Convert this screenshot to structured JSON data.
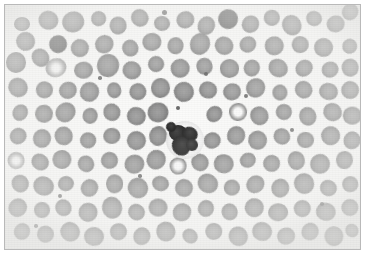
{
  "figure": {
    "modality": "light-microscopy",
    "stain": "grayscale (monochrome reproduction of Wright-Giemsa)",
    "frame": {
      "border_color": "#b9b9b9",
      "border_width_px": 1,
      "margin_px": 4
    },
    "canvas": {
      "width_px": 367,
      "height_px": 256,
      "background_color": "#fbfbfa"
    },
    "palette": {
      "background": "#fbfbfa",
      "rbc_mid_gray": "#8e8e8e",
      "rbc_dark_gray": "#5c5c5c",
      "rbc_pale_center": "#f7f7f7",
      "wbc_nucleus": "#1e1e1e",
      "wbc_cytoplasm": "#f4f4f4",
      "frame": "#b9b9b9"
    },
    "caption": "",
    "labels": [],
    "scale_bar": null,
    "annotations": []
  },
  "cells": {
    "white_blood_cells": [
      {
        "name": "neutrophil",
        "cx": 185,
        "cy": 140,
        "r": 19,
        "nucleus_lobes": [
          {
            "cx": 178,
            "cy": 133,
            "rx": 9,
            "ry": 8
          },
          {
            "cx": 190,
            "cy": 134,
            "rx": 8,
            "ry": 7
          },
          {
            "cx": 181,
            "cy": 146,
            "rx": 10,
            "ry": 9
          },
          {
            "cx": 192,
            "cy": 145,
            "rx": 6,
            "ry": 6
          },
          {
            "cx": 171,
            "cy": 127,
            "rx": 5,
            "ry": 5
          }
        ],
        "bridges": [
          {
            "cx": 184,
            "cy": 138,
            "w": 12,
            "h": 7,
            "rot": 18
          },
          {
            "cx": 186,
            "cy": 144,
            "w": 11,
            "h": 6,
            "rot": -14
          }
        ]
      }
    ],
    "red_blood_cells": [
      {
        "cx": 22,
        "cy": 24,
        "r": 9,
        "t": "normal"
      },
      {
        "cx": 26,
        "cy": 42,
        "r": 10,
        "t": "normal"
      },
      {
        "cx": 48,
        "cy": 20,
        "r": 9,
        "t": "normal"
      },
      {
        "cx": 73,
        "cy": 22,
        "r": 10,
        "t": "normal"
      },
      {
        "cx": 98,
        "cy": 19,
        "r": 8,
        "t": "normal"
      },
      {
        "cx": 118,
        "cy": 26,
        "r": 9,
        "t": "normal"
      },
      {
        "cx": 140,
        "cy": 18,
        "r": 8,
        "t": "normal"
      },
      {
        "cx": 162,
        "cy": 23,
        "r": 9,
        "t": "normal"
      },
      {
        "cx": 186,
        "cy": 20,
        "r": 9,
        "t": "normal"
      },
      {
        "cx": 206,
        "cy": 26,
        "r": 9,
        "t": "normal"
      },
      {
        "cx": 228,
        "cy": 19,
        "r": 9,
        "t": "dark"
      },
      {
        "cx": 250,
        "cy": 24,
        "r": 9,
        "t": "normal"
      },
      {
        "cx": 272,
        "cy": 18,
        "r": 8,
        "t": "normal"
      },
      {
        "cx": 292,
        "cy": 25,
        "r": 9,
        "t": "normal"
      },
      {
        "cx": 314,
        "cy": 19,
        "r": 9,
        "t": "normal"
      },
      {
        "cx": 336,
        "cy": 24,
        "r": 9,
        "t": "normal"
      },
      {
        "cx": 350,
        "cy": 12,
        "r": 8,
        "t": "normal"
      },
      {
        "cx": 16,
        "cy": 62,
        "r": 9,
        "t": "normal"
      },
      {
        "cx": 40,
        "cy": 58,
        "r": 10,
        "t": "normal"
      },
      {
        "cx": 58,
        "cy": 44,
        "r": 9,
        "t": "dark"
      },
      {
        "cx": 56,
        "cy": 68,
        "r": 10,
        "t": "pale"
      },
      {
        "cx": 80,
        "cy": 48,
        "r": 10,
        "t": "normal"
      },
      {
        "cx": 84,
        "cy": 70,
        "r": 9,
        "t": "normal"
      },
      {
        "cx": 104,
        "cy": 44,
        "r": 9,
        "t": "normal"
      },
      {
        "cx": 108,
        "cy": 66,
        "r": 10,
        "t": "normal"
      },
      {
        "cx": 130,
        "cy": 48,
        "r": 9,
        "t": "normal"
      },
      {
        "cx": 132,
        "cy": 70,
        "r": 9,
        "t": "normal"
      },
      {
        "cx": 152,
        "cy": 42,
        "r": 9,
        "t": "normal"
      },
      {
        "cx": 156,
        "cy": 64,
        "r": 9,
        "t": "normal"
      },
      {
        "cx": 176,
        "cy": 46,
        "r": 9,
        "t": "normal"
      },
      {
        "cx": 180,
        "cy": 68,
        "r": 9,
        "t": "normal"
      },
      {
        "cx": 200,
        "cy": 44,
        "r": 9,
        "t": "normal"
      },
      {
        "cx": 204,
        "cy": 66,
        "r": 9,
        "t": "normal"
      },
      {
        "cx": 224,
        "cy": 46,
        "r": 9,
        "t": "normal"
      },
      {
        "cx": 230,
        "cy": 68,
        "r": 9,
        "t": "normal"
      },
      {
        "cx": 248,
        "cy": 44,
        "r": 9,
        "t": "normal"
      },
      {
        "cx": 252,
        "cy": 68,
        "r": 9,
        "t": "normal"
      },
      {
        "cx": 274,
        "cy": 46,
        "r": 9,
        "t": "normal"
      },
      {
        "cx": 278,
        "cy": 68,
        "r": 9,
        "t": "normal"
      },
      {
        "cx": 300,
        "cy": 44,
        "r": 9,
        "t": "normal"
      },
      {
        "cx": 304,
        "cy": 68,
        "r": 9,
        "t": "normal"
      },
      {
        "cx": 324,
        "cy": 48,
        "r": 9,
        "t": "normal"
      },
      {
        "cx": 330,
        "cy": 70,
        "r": 9,
        "t": "normal"
      },
      {
        "cx": 350,
        "cy": 46,
        "r": 8,
        "t": "normal"
      },
      {
        "cx": 350,
        "cy": 68,
        "r": 8,
        "t": "normal"
      },
      {
        "cx": 18,
        "cy": 88,
        "r": 9,
        "t": "normal"
      },
      {
        "cx": 44,
        "cy": 90,
        "r": 9,
        "t": "normal"
      },
      {
        "cx": 68,
        "cy": 90,
        "r": 9,
        "t": "normal"
      },
      {
        "cx": 90,
        "cy": 92,
        "r": 9,
        "t": "normal"
      },
      {
        "cx": 114,
        "cy": 90,
        "r": 9,
        "t": "normal"
      },
      {
        "cx": 138,
        "cy": 92,
        "r": 9,
        "t": "normal"
      },
      {
        "cx": 160,
        "cy": 88,
        "r": 9,
        "t": "normal"
      },
      {
        "cx": 184,
        "cy": 92,
        "r": 9,
        "t": "normal"
      },
      {
        "cx": 208,
        "cy": 90,
        "r": 9,
        "t": "normal"
      },
      {
        "cx": 232,
        "cy": 92,
        "r": 9,
        "t": "normal"
      },
      {
        "cx": 256,
        "cy": 88,
        "r": 9,
        "t": "normal"
      },
      {
        "cx": 280,
        "cy": 92,
        "r": 9,
        "t": "normal"
      },
      {
        "cx": 304,
        "cy": 90,
        "r": 9,
        "t": "normal"
      },
      {
        "cx": 328,
        "cy": 92,
        "r": 9,
        "t": "normal"
      },
      {
        "cx": 350,
        "cy": 90,
        "r": 8,
        "t": "normal"
      },
      {
        "cx": 20,
        "cy": 112,
        "r": 9,
        "t": "normal"
      },
      {
        "cx": 44,
        "cy": 114,
        "r": 9,
        "t": "normal"
      },
      {
        "cx": 66,
        "cy": 112,
        "r": 9,
        "t": "normal"
      },
      {
        "cx": 90,
        "cy": 116,
        "r": 9,
        "t": "normal"
      },
      {
        "cx": 112,
        "cy": 112,
        "r": 9,
        "t": "normal"
      },
      {
        "cx": 136,
        "cy": 116,
        "r": 9,
        "t": "normal"
      },
      {
        "cx": 158,
        "cy": 112,
        "r": 9,
        "t": "normal"
      },
      {
        "cx": 214,
        "cy": 114,
        "r": 9,
        "t": "normal"
      },
      {
        "cx": 238,
        "cy": 112,
        "r": 9,
        "t": "ring"
      },
      {
        "cx": 260,
        "cy": 116,
        "r": 9,
        "t": "normal"
      },
      {
        "cx": 284,
        "cy": 112,
        "r": 9,
        "t": "normal"
      },
      {
        "cx": 308,
        "cy": 116,
        "r": 9,
        "t": "normal"
      },
      {
        "cx": 332,
        "cy": 112,
        "r": 9,
        "t": "normal"
      },
      {
        "cx": 352,
        "cy": 116,
        "r": 8,
        "t": "normal"
      },
      {
        "cx": 18,
        "cy": 136,
        "r": 9,
        "t": "normal"
      },
      {
        "cx": 42,
        "cy": 138,
        "r": 9,
        "t": "normal"
      },
      {
        "cx": 64,
        "cy": 136,
        "r": 9,
        "t": "normal"
      },
      {
        "cx": 88,
        "cy": 140,
        "r": 9,
        "t": "normal"
      },
      {
        "cx": 112,
        "cy": 136,
        "r": 9,
        "t": "normal"
      },
      {
        "cx": 136,
        "cy": 140,
        "r": 9,
        "t": "normal"
      },
      {
        "cx": 158,
        "cy": 136,
        "r": 9,
        "t": "normal"
      },
      {
        "cx": 212,
        "cy": 140,
        "r": 9,
        "t": "normal"
      },
      {
        "cx": 236,
        "cy": 136,
        "r": 9,
        "t": "normal"
      },
      {
        "cx": 258,
        "cy": 140,
        "r": 9,
        "t": "normal"
      },
      {
        "cx": 282,
        "cy": 136,
        "r": 9,
        "t": "normal"
      },
      {
        "cx": 306,
        "cy": 140,
        "r": 9,
        "t": "normal"
      },
      {
        "cx": 330,
        "cy": 136,
        "r": 9,
        "t": "normal"
      },
      {
        "cx": 352,
        "cy": 140,
        "r": 8,
        "t": "normal"
      },
      {
        "cx": 16,
        "cy": 160,
        "r": 9,
        "t": "pale"
      },
      {
        "cx": 40,
        "cy": 162,
        "r": 9,
        "t": "normal"
      },
      {
        "cx": 62,
        "cy": 160,
        "r": 9,
        "t": "normal"
      },
      {
        "cx": 86,
        "cy": 164,
        "r": 9,
        "t": "normal"
      },
      {
        "cx": 110,
        "cy": 160,
        "r": 9,
        "t": "normal"
      },
      {
        "cx": 134,
        "cy": 164,
        "r": 9,
        "t": "normal"
      },
      {
        "cx": 156,
        "cy": 160,
        "r": 9,
        "t": "normal"
      },
      {
        "cx": 178,
        "cy": 166,
        "r": 9,
        "t": "ring"
      },
      {
        "cx": 200,
        "cy": 162,
        "r": 9,
        "t": "normal"
      },
      {
        "cx": 224,
        "cy": 164,
        "r": 9,
        "t": "normal"
      },
      {
        "cx": 248,
        "cy": 160,
        "r": 9,
        "t": "normal"
      },
      {
        "cx": 272,
        "cy": 164,
        "r": 9,
        "t": "normal"
      },
      {
        "cx": 296,
        "cy": 160,
        "r": 9,
        "t": "normal"
      },
      {
        "cx": 320,
        "cy": 164,
        "r": 9,
        "t": "normal"
      },
      {
        "cx": 344,
        "cy": 160,
        "r": 9,
        "t": "normal"
      },
      {
        "cx": 20,
        "cy": 184,
        "r": 9,
        "t": "normal"
      },
      {
        "cx": 44,
        "cy": 186,
        "r": 9,
        "t": "normal"
      },
      {
        "cx": 66,
        "cy": 184,
        "r": 9,
        "t": "normal"
      },
      {
        "cx": 90,
        "cy": 188,
        "r": 9,
        "t": "normal"
      },
      {
        "cx": 114,
        "cy": 184,
        "r": 9,
        "t": "normal"
      },
      {
        "cx": 138,
        "cy": 188,
        "r": 9,
        "t": "normal"
      },
      {
        "cx": 160,
        "cy": 184,
        "r": 9,
        "t": "normal"
      },
      {
        "cx": 184,
        "cy": 188,
        "r": 9,
        "t": "normal"
      },
      {
        "cx": 208,
        "cy": 184,
        "r": 9,
        "t": "normal"
      },
      {
        "cx": 232,
        "cy": 188,
        "r": 9,
        "t": "normal"
      },
      {
        "cx": 256,
        "cy": 184,
        "r": 9,
        "t": "normal"
      },
      {
        "cx": 280,
        "cy": 188,
        "r": 9,
        "t": "normal"
      },
      {
        "cx": 304,
        "cy": 184,
        "r": 9,
        "t": "normal"
      },
      {
        "cx": 328,
        "cy": 188,
        "r": 9,
        "t": "normal"
      },
      {
        "cx": 350,
        "cy": 184,
        "r": 8,
        "t": "normal"
      },
      {
        "cx": 18,
        "cy": 208,
        "r": 9,
        "t": "normal"
      },
      {
        "cx": 42,
        "cy": 210,
        "r": 9,
        "t": "normal"
      },
      {
        "cx": 64,
        "cy": 208,
        "r": 9,
        "t": "normal"
      },
      {
        "cx": 88,
        "cy": 212,
        "r": 9,
        "t": "normal"
      },
      {
        "cx": 112,
        "cy": 208,
        "r": 9,
        "t": "normal"
      },
      {
        "cx": 136,
        "cy": 212,
        "r": 9,
        "t": "normal"
      },
      {
        "cx": 158,
        "cy": 208,
        "r": 9,
        "t": "normal"
      },
      {
        "cx": 182,
        "cy": 212,
        "r": 9,
        "t": "normal"
      },
      {
        "cx": 206,
        "cy": 208,
        "r": 9,
        "t": "normal"
      },
      {
        "cx": 230,
        "cy": 212,
        "r": 9,
        "t": "normal"
      },
      {
        "cx": 254,
        "cy": 208,
        "r": 9,
        "t": "normal"
      },
      {
        "cx": 278,
        "cy": 212,
        "r": 9,
        "t": "normal"
      },
      {
        "cx": 302,
        "cy": 208,
        "r": 9,
        "t": "normal"
      },
      {
        "cx": 326,
        "cy": 212,
        "r": 9,
        "t": "normal"
      },
      {
        "cx": 350,
        "cy": 208,
        "r": 8,
        "t": "normal"
      },
      {
        "cx": 22,
        "cy": 232,
        "r": 9,
        "t": "normal"
      },
      {
        "cx": 46,
        "cy": 234,
        "r": 9,
        "t": "normal"
      },
      {
        "cx": 70,
        "cy": 232,
        "r": 9,
        "t": "normal"
      },
      {
        "cx": 94,
        "cy": 236,
        "r": 9,
        "t": "normal"
      },
      {
        "cx": 118,
        "cy": 232,
        "r": 9,
        "t": "normal"
      },
      {
        "cx": 142,
        "cy": 236,
        "r": 9,
        "t": "normal"
      },
      {
        "cx": 166,
        "cy": 232,
        "r": 9,
        "t": "normal"
      },
      {
        "cx": 190,
        "cy": 236,
        "r": 9,
        "t": "normal"
      },
      {
        "cx": 214,
        "cy": 232,
        "r": 9,
        "t": "normal"
      },
      {
        "cx": 238,
        "cy": 236,
        "r": 9,
        "t": "normal"
      },
      {
        "cx": 262,
        "cy": 232,
        "r": 9,
        "t": "normal"
      },
      {
        "cx": 286,
        "cy": 236,
        "r": 9,
        "t": "normal"
      },
      {
        "cx": 310,
        "cy": 232,
        "r": 9,
        "t": "normal"
      },
      {
        "cx": 334,
        "cy": 236,
        "r": 9,
        "t": "normal"
      },
      {
        "cx": 352,
        "cy": 230,
        "r": 8,
        "t": "normal"
      }
    ],
    "platelets": [
      {
        "cx": 164,
        "cy": 12,
        "r": 2.5
      },
      {
        "cx": 206,
        "cy": 74,
        "r": 2.0
      },
      {
        "cx": 100,
        "cy": 78,
        "r": 1.8
      },
      {
        "cx": 246,
        "cy": 96,
        "r": 2.2
      },
      {
        "cx": 60,
        "cy": 196,
        "r": 2.0
      },
      {
        "cx": 140,
        "cy": 176,
        "r": 1.8
      },
      {
        "cx": 292,
        "cy": 130,
        "r": 2.0
      },
      {
        "cx": 322,
        "cy": 204,
        "r": 2.2
      },
      {
        "cx": 36,
        "cy": 226,
        "r": 1.8
      },
      {
        "cx": 178,
        "cy": 108,
        "r": 2.0
      }
    ]
  }
}
